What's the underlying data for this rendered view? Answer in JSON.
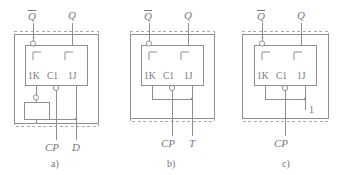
{
  "figure": {
    "type": "schematic-diagram",
    "background_color": "#ffffff",
    "line_color": "#8f8f93",
    "text_color": "#77777c",
    "panel_count": 3
  },
  "panels": [
    {
      "id": "a",
      "caption": "a)",
      "description": "JK flip-flop wired as a D flip-flop using an inverter on the K input",
      "outputs": [
        {
          "name": "q-bar-output",
          "label": "Q",
          "overbar": true
        },
        {
          "name": "q-output",
          "label": "Q",
          "overbar": false
        }
      ],
      "pins": [
        {
          "name": "pin-1k",
          "label": "1K"
        },
        {
          "name": "pin-c1",
          "label": "C1"
        },
        {
          "name": "pin-1j",
          "label": "1J"
        }
      ],
      "inputs": [
        {
          "name": "clock-input",
          "label": "CP"
        },
        {
          "name": "data-input",
          "label": "D"
        }
      ],
      "has_inverter": true,
      "inverter_name": "inverter-block"
    },
    {
      "id": "b",
      "caption": "b)",
      "description": "JK flip-flop wired as a T flip-flop with J and K tied to T",
      "outputs": [
        {
          "name": "q-bar-output",
          "label": "Q",
          "overbar": true
        },
        {
          "name": "q-output",
          "label": "Q",
          "overbar": false
        }
      ],
      "pins": [
        {
          "name": "pin-1k",
          "label": "1K"
        },
        {
          "name": "pin-c1",
          "label": "C1"
        },
        {
          "name": "pin-1j",
          "label": "1J"
        }
      ],
      "inputs": [
        {
          "name": "clock-input",
          "label": "CP"
        },
        {
          "name": "toggle-input",
          "label": "T"
        }
      ],
      "has_inverter": false,
      "inverter_name": ""
    },
    {
      "id": "c",
      "caption": "c)",
      "description": "JK flip-flop wired as a toggle flip-flop with J and K tied to logic 1",
      "outputs": [
        {
          "name": "q-bar-output",
          "label": "Q",
          "overbar": true
        },
        {
          "name": "q-output",
          "label": "Q",
          "overbar": false
        }
      ],
      "pins": [
        {
          "name": "pin-1k",
          "label": "1K"
        },
        {
          "name": "pin-c1",
          "label": "C1"
        },
        {
          "name": "pin-1j",
          "label": "1J"
        }
      ],
      "inputs": [
        {
          "name": "clock-input",
          "label": "CP"
        }
      ],
      "logic_level": {
        "name": "logic-high-label",
        "label": "1"
      },
      "has_inverter": false,
      "inverter_name": ""
    }
  ]
}
